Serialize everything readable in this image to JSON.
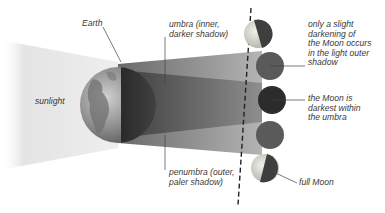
{
  "diagram": {
    "labels": {
      "earth": "Earth",
      "sunlight": "sunlight",
      "umbra": "umbra (inner,\ndarker shadow)",
      "penumbra": "penumbra (outer,\npaler shadow)",
      "slight_darkening": "only a slight\ndarkening of\nthe Moon occurs\nin the light outer\nshadow",
      "darkest": "the Moon is\ndarkest within\nthe umbra",
      "full_moon": "full Moon"
    },
    "moon_phases": [
      {
        "id": "moon-1",
        "state": "partially lit (entering penumbra)"
      },
      {
        "id": "moon-2",
        "state": "in penumbra"
      },
      {
        "id": "moon-3",
        "state": "in umbra (darkest)"
      },
      {
        "id": "moon-4",
        "state": "in penumbra"
      },
      {
        "id": "moon-5",
        "state": "partially lit (full Moon)"
      }
    ],
    "colors": {
      "umbra": "#4a4a4a",
      "penumbra": "#8a8a8a",
      "sunlight": "#e6e6e6",
      "moon_dark": "#3a3a3a",
      "moon_lit": "#d8d8d0",
      "text": "#3a3a3a"
    }
  }
}
